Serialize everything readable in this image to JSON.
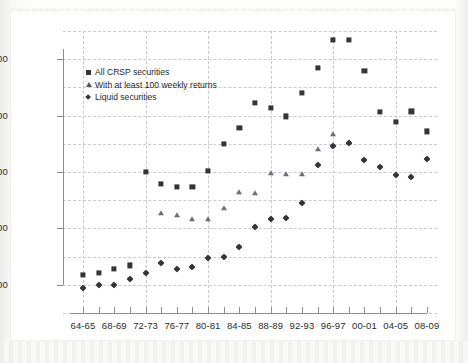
{
  "chart_data": {
    "type": "scatter",
    "title": "",
    "xlabel": "",
    "ylabel": "",
    "ylim": [
      1000,
      11000
    ],
    "yticks": [
      2000,
      4000,
      6000,
      8000,
      10000
    ],
    "ytick_labels": [
      "2000",
      "4000",
      "6000",
      "8000",
      "10000"
    ],
    "gridlines_y": [
      1000,
      2000,
      3000,
      4000,
      5000,
      6000,
      7000,
      8000,
      9000,
      10000,
      11000
    ],
    "grid": "dashed both axes",
    "legend_position": "upper left inside plot",
    "x_categories": [
      "64-65",
      "66-67",
      "68-69",
      "70-71",
      "72-73",
      "74-75",
      "76-77",
      "78-79",
      "80-81",
      "82-83",
      "84-85",
      "86-87",
      "88-89",
      "90-91",
      "92-93",
      "94-95",
      "96-97",
      "98-99",
      "00-01",
      "02-03",
      "04-05",
      "06-07",
      "08-09"
    ],
    "x_tick_labels_shown": [
      "64-65",
      "68-69",
      "72-73",
      "76-77",
      "80-81",
      "84-85",
      "88-89",
      "92-93",
      "96-97",
      "00-01",
      "04-05",
      "08-09"
    ],
    "series": [
      {
        "name": "All CRSP securities",
        "marker": "square",
        "color": "#33333a",
        "values": [
          2340,
          2430,
          2560,
          2690,
          6010,
          5570,
          5470,
          5470,
          6040,
          7000,
          7560,
          8440,
          8280,
          7970,
          8810,
          9690,
          10680,
          10680,
          9590,
          8120,
          7790,
          8150,
          7440
        ]
      },
      {
        "name": "With at least 100 weekly returns",
        "marker": "triangle",
        "color": "#6e6e78",
        "values": [
          null,
          null,
          null,
          null,
          null,
          4560,
          4480,
          4350,
          4340,
          4730,
          5280,
          5250,
          5950,
          5930,
          5940,
          6810,
          7330,
          7060,
          null,
          null,
          null,
          null,
          null
        ]
      },
      {
        "name": "Liquid securities",
        "marker": "diamond",
        "color": "#33333a",
        "values": [
          1900,
          1980,
          1990,
          2220,
          2410,
          2760,
          2550,
          2640,
          2940,
          2980,
          3350,
          4040,
          4320,
          4370,
          4900,
          6240,
          6930,
          7020,
          6440,
          6180,
          5880,
          5820,
          6460
        ]
      }
    ],
    "legend_entries": [
      {
        "label": "All CRSP securities",
        "marker": "square"
      },
      {
        "label": "With at least 100 weekly returns",
        "marker": "triangle"
      },
      {
        "label": "Liquid securities",
        "marker": "diamond"
      }
    ]
  }
}
